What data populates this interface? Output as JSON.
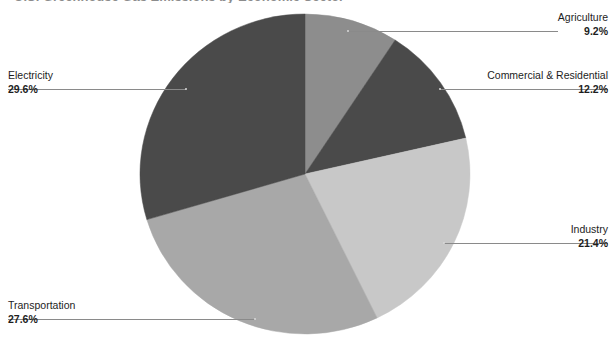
{
  "figure": {
    "width": 616,
    "height": 350,
    "background": "#ffffff",
    "title_remnant": "U.S. Greenhouse Gas Emissions by Economic Sector"
  },
  "chart_data": {
    "type": "pie",
    "title": "",
    "xlabel": "",
    "ylabel": "",
    "legend_position": "callout-labels",
    "grid": false,
    "units": "percent",
    "start_angle_deg": 0,
    "direction": "clockwise",
    "categories": [
      "Agriculture",
      "Commercial & Residential",
      "Industry",
      "Transportation",
      "Electricity"
    ],
    "values": [
      9.2,
      12.2,
      21.4,
      27.6,
      29.6
    ],
    "colors": [
      "#8d8d8d",
      "#4a4a4a",
      "#c8c8c8",
      "#a8a8a8",
      "#4a4a4a"
    ],
    "slices": [
      {
        "label": "Agriculture",
        "value": 9.2,
        "value_text": "9.2%",
        "color": "#8d8d8d",
        "start_deg": 0.0,
        "end_deg": 33.12,
        "label_side": "right"
      },
      {
        "label": "Commercial & Residential",
        "value": 12.2,
        "value_text": "12.2%",
        "color": "#4a4a4a",
        "start_deg": 33.12,
        "end_deg": 77.04,
        "label_side": "right"
      },
      {
        "label": "Industry",
        "value": 21.4,
        "value_text": "21.4%",
        "color": "#c8c8c8",
        "start_deg": 77.04,
        "end_deg": 154.08,
        "label_side": "right"
      },
      {
        "label": "Transportation",
        "value": 27.6,
        "value_text": "27.6%",
        "color": "#a8a8a8",
        "start_deg": 154.08,
        "end_deg": 253.44,
        "label_side": "left"
      },
      {
        "label": "Electricity",
        "value": 29.6,
        "value_text": "29.6%",
        "color": "#4a4a4a",
        "start_deg": 253.44,
        "end_deg": 360.0,
        "label_side": "left"
      }
    ]
  },
  "callouts": {
    "agriculture": {
      "category": "Agriculture",
      "percent": "9.2%"
    },
    "commercial_residential": {
      "category": "Commercial & Residential",
      "percent": "12.2%"
    },
    "industry": {
      "category": "Industry",
      "percent": "21.4%"
    },
    "transportation": {
      "category": "Transportation",
      "percent": "27.6%"
    },
    "electricity": {
      "category": "Electricity",
      "percent": "29.6%"
    }
  }
}
